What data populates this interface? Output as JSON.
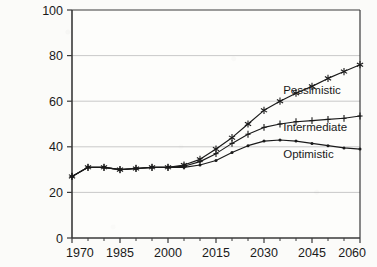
{
  "chart_data": {
    "type": "line",
    "title": "",
    "subtitle": "",
    "xlabel": "",
    "ylabel": "",
    "xlim": [
      1970,
      2060
    ],
    "ylim": [
      0,
      100
    ],
    "grid": true,
    "legend_position": "inline-right",
    "x_ticks": [
      1970,
      1985,
      2000,
      2015,
      2030,
      2045,
      2060
    ],
    "x_tick_labels": [
      "1970",
      "1985",
      "2000",
      "2015",
      "2030",
      "2045",
      "2060"
    ],
    "x_minor_ticks": [
      1975,
      1980,
      1990,
      1995,
      2005,
      2010,
      2020,
      2025,
      2035,
      2040,
      2050,
      2055
    ],
    "y_ticks": [
      0,
      20,
      40,
      60,
      80,
      100
    ],
    "y_tick_labels": [
      "0",
      "20",
      "40",
      "60",
      "80",
      "100"
    ],
    "x": [
      1970,
      1975,
      1980,
      1985,
      1990,
      1995,
      2000,
      2005,
      2010,
      2015,
      2020,
      2025,
      2030,
      2035,
      2040,
      2045,
      2050,
      2055,
      2060
    ],
    "series": [
      {
        "name": "Pessimistic",
        "marker": "asterisk",
        "label_x": 2036,
        "label_y": 63,
        "values": [
          27,
          31,
          31,
          30,
          30.5,
          31,
          31,
          32,
          34.5,
          39,
          44,
          50,
          56,
          60,
          63.5,
          66.5,
          70,
          73,
          76
        ]
      },
      {
        "name": "Intermediate",
        "marker": "plus",
        "label_x": 2036,
        "label_y": 47,
        "values": [
          27,
          31,
          31,
          30,
          30.5,
          31,
          31,
          31.5,
          33.5,
          37,
          41.5,
          45.5,
          48.5,
          50,
          51,
          51.5,
          52,
          52.5,
          53.5
        ]
      },
      {
        "name": "Optimistic",
        "marker": "dot",
        "label_x": 2036,
        "label_y": 35,
        "values": [
          27,
          31,
          31,
          30,
          30.5,
          31,
          31,
          31,
          32,
          34,
          37.5,
          40.5,
          42.5,
          43,
          42.5,
          41.5,
          40.5,
          39.5,
          39
        ]
      }
    ],
    "colors": {
      "line": "#1a1a1a",
      "grid": "#c9c9c9",
      "axis": "#3a3a3a",
      "background": "#fbfbf9"
    }
  }
}
